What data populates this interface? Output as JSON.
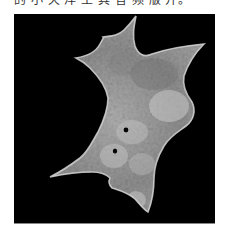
{
  "document": {
    "caption_fragment": "的 小 天 洋 土 其 音 频 版 开。"
  },
  "figure": {
    "type": "grayscale micrograph",
    "background_color": "#000000",
    "cell_fill_color": "#9a9a9a",
    "cell_highlight_color": "#d8d8d8",
    "cell_shadow_color": "#5a5a5a",
    "features": [
      "dark-spot",
      "dark-spot"
    ]
  }
}
